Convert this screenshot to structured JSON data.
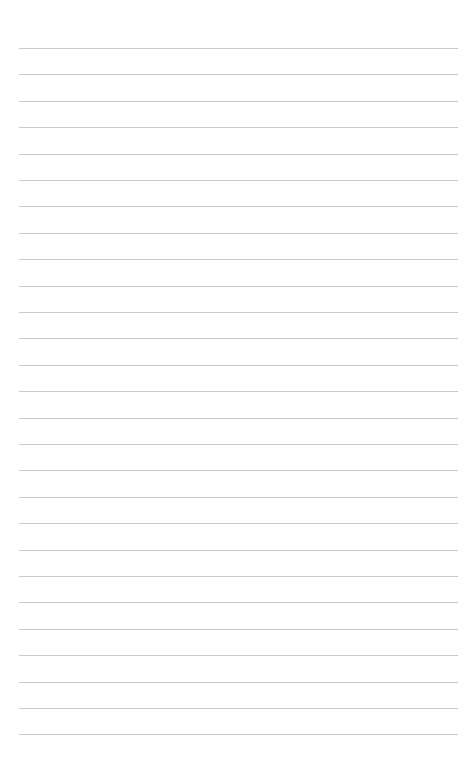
{
  "page": {
    "type": "lined-paper",
    "background": "#ffffff",
    "line_color": "#c9c9c9",
    "line_count": 27,
    "first_line_y": 48,
    "line_spacing": 26.4,
    "line_left": 19,
    "line_width": 439
  }
}
